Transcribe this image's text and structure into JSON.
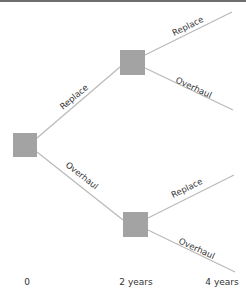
{
  "diagram": {
    "type": "decision-tree",
    "colors": {
      "node": "#a3a3a3",
      "branch": "#b9b9b9",
      "text": "#333333",
      "top_rule": "#6e6e6e"
    },
    "nodes": [
      {
        "id": "root",
        "kind": "decision",
        "time": "0"
      },
      {
        "id": "upper",
        "kind": "decision",
        "time": "2 years"
      },
      {
        "id": "lower",
        "kind": "decision",
        "time": "2 years"
      }
    ],
    "branches": [
      {
        "from": "root",
        "to": "upper",
        "label": "Replace"
      },
      {
        "from": "root",
        "to": "lower",
        "label": "Overhaul"
      },
      {
        "from": "upper",
        "to": "end1",
        "label": "Replace"
      },
      {
        "from": "upper",
        "to": "end2",
        "label": "Overhaul"
      },
      {
        "from": "lower",
        "to": "end3",
        "label": "Replace"
      },
      {
        "from": "lower",
        "to": "end4",
        "label": "Overhaul"
      }
    ],
    "time_axis": [
      "0",
      "2 years",
      "4 years"
    ]
  }
}
